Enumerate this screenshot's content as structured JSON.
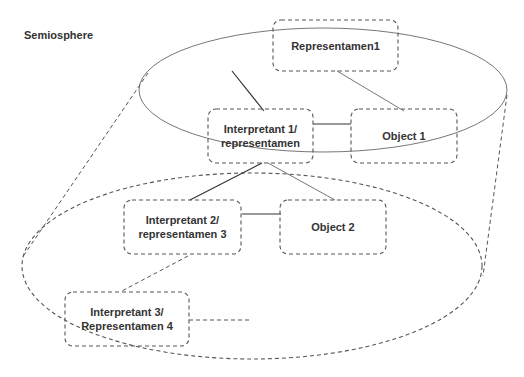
{
  "diagram": {
    "title": "Semiosphere",
    "nodes": [
      {
        "id": "rep1",
        "label": "Representamen1"
      },
      {
        "id": "int1",
        "label_line1": "Interpretant 1/",
        "label_line2": "representamen"
      },
      {
        "id": "obj1",
        "label": "Object 1"
      },
      {
        "id": "int2",
        "label_line1": "Interpretant 2/",
        "label_line2": "representamen 3"
      },
      {
        "id": "obj2",
        "label": "Object 2"
      },
      {
        "id": "int3",
        "label_line1": "Interpretant 3/",
        "label_line2": "Representamen 4"
      }
    ],
    "edges": [
      {
        "from": "rep1",
        "to": "int1",
        "style": "solid"
      },
      {
        "from": "rep1",
        "to": "obj1",
        "style": "solid-thin"
      },
      {
        "from": "int1",
        "to": "obj1",
        "style": "solid"
      },
      {
        "from": "int1",
        "to": "int2",
        "style": "solid"
      },
      {
        "from": "int1",
        "to": "obj2",
        "style": "solid-thin"
      },
      {
        "from": "int2",
        "to": "obj2",
        "style": "solid"
      },
      {
        "from": "int2",
        "to": "int3",
        "style": "dashed"
      },
      {
        "from": "int3",
        "to": "open",
        "style": "dashed"
      }
    ],
    "colors": {
      "stroke": "#555555",
      "text": "#333333",
      "background": "#ffffff"
    }
  }
}
